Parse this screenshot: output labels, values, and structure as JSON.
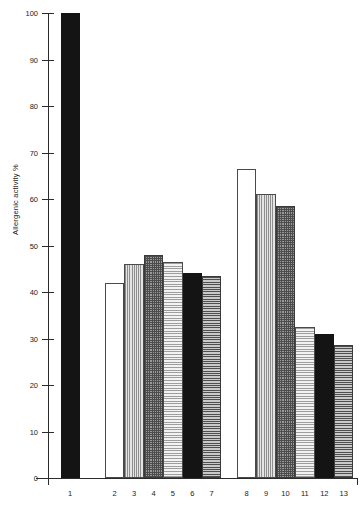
{
  "chart_data": {
    "type": "bar",
    "title": "",
    "xlabel": "",
    "ylabel": "Allergenic activity %",
    "ylim": [
      0,
      100
    ],
    "yticks": [
      0,
      10,
      20,
      30,
      40,
      50,
      60,
      70,
      80,
      90,
      100
    ],
    "grid": false,
    "legend": "none",
    "categories": [
      "1",
      "2",
      "3",
      "4",
      "5",
      "6",
      "7",
      "8",
      "9",
      "10",
      "11",
      "12",
      "13"
    ],
    "values": [
      100,
      42,
      46,
      48,
      46.5,
      44,
      43.5,
      66.5,
      61,
      58.5,
      32.5,
      31,
      28.5
    ],
    "groups": [
      {
        "name": "group-1",
        "categories": [
          "1"
        ]
      },
      {
        "name": "group-2",
        "categories": [
          "2",
          "3",
          "4",
          "5",
          "6",
          "7"
        ]
      },
      {
        "name": "group-3",
        "categories": [
          "8",
          "9",
          "10",
          "11",
          "12",
          "13"
        ]
      }
    ],
    "bars": [
      {
        "label": "1",
        "value": 100,
        "fill": "solid-black"
      },
      {
        "label": "2",
        "value": 42,
        "fill": "white"
      },
      {
        "label": "3",
        "value": 46,
        "fill": "vert-light"
      },
      {
        "label": "4",
        "value": 48,
        "fill": "cross-dark"
      },
      {
        "label": "5",
        "value": 46.5,
        "fill": "horiz-light"
      },
      {
        "label": "6",
        "value": 44,
        "fill": "solid-black"
      },
      {
        "label": "7",
        "value": 43.5,
        "fill": "horiz-mid"
      },
      {
        "label": "8",
        "value": 66.5,
        "fill": "white"
      },
      {
        "label": "9",
        "value": 61,
        "fill": "vert-light"
      },
      {
        "label": "10",
        "value": 58.5,
        "fill": "cross-dark"
      },
      {
        "label": "11",
        "value": 32.5,
        "fill": "horiz-light"
      },
      {
        "label": "12",
        "value": 31,
        "fill": "solid-black"
      },
      {
        "label": "13",
        "value": 28.5,
        "fill": "horiz-mid"
      }
    ]
  },
  "axis": {
    "y_title": "Allergenic activity %",
    "y_tick_labels": [
      "100",
      "90",
      "80",
      "70",
      "60",
      "50",
      "40",
      "30",
      "20",
      "10",
      "0"
    ],
    "x_tick_labels": [
      "1",
      "2",
      "3",
      "4",
      "5",
      "6",
      "7",
      "8",
      "9",
      "10",
      "11",
      "12",
      "13"
    ]
  }
}
